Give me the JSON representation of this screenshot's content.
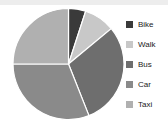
{
  "chart_data": {
    "type": "pie",
    "title": "",
    "categories": [
      "Bike",
      "Walk",
      "Bus",
      "Car",
      "Taxi"
    ],
    "values": [
      5,
      9,
      30,
      31,
      25
    ],
    "colors": [
      "#3a3a3a",
      "#c8c8c8",
      "#6e6e6e",
      "#8a8a8a",
      "#b0b0b0"
    ],
    "legend_position": "right",
    "grid": false,
    "start_angle_deg": 0,
    "direction": "clockwise",
    "slice_border_color": "#ffffff"
  },
  "legend": {
    "items": [
      {
        "label": "Bike",
        "color": "#3a3a3a"
      },
      {
        "label": "Walk",
        "color": "#c8c8c8"
      },
      {
        "label": "Bus",
        "color": "#6e6e6e"
      },
      {
        "label": "Car",
        "color": "#8a8a8a"
      },
      {
        "label": "Taxi",
        "color": "#b0b0b0"
      }
    ]
  },
  "canvas": {
    "background": "#ffffff",
    "top_band_color": "#ededed"
  }
}
